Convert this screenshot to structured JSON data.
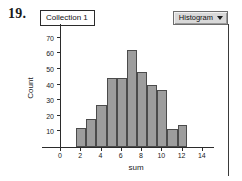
{
  "question_number": "19.",
  "collection": {
    "label": "Collection 1"
  },
  "plot_selector": {
    "label": "Histogram",
    "icon": "chevron-down-icon"
  },
  "chart_data": {
    "type": "bar",
    "title": "",
    "subtitle": "",
    "xlabel": "sum",
    "ylabel": "Count",
    "xlim": [
      0,
      15
    ],
    "ylim": [
      0,
      75
    ],
    "xticks": [
      0,
      2,
      4,
      6,
      8,
      10,
      12,
      14
    ],
    "xtick_labels": [
      "0",
      "2",
      "4",
      "6",
      "8",
      "10",
      "12",
      "14"
    ],
    "yticks": [
      10,
      20,
      30,
      40,
      50,
      60,
      70
    ],
    "ytick_labels": [
      "10",
      "20",
      "30",
      "40",
      "50",
      "60",
      "70"
    ],
    "grid": false,
    "legend": null,
    "bin_width": 1,
    "bin_edges": [
      1.6,
      2.6,
      3.6,
      4.6,
      5.6,
      6.6,
      7.6,
      8.6,
      9.6,
      10.6,
      11.6,
      12.5
    ],
    "categories": [
      "1.6-2.6",
      "2.6-3.6",
      "3.6-4.6",
      "4.6-5.6",
      "5.6-6.6",
      "6.6-7.6",
      "7.6-8.6",
      "8.6-9.6",
      "9.6-10.6",
      "10.6-11.6",
      "11.6-12.5"
    ],
    "values": [
      12,
      18,
      27,
      44,
      44,
      62,
      48,
      39.5,
      36.5,
      11.5,
      14
    ],
    "bar_color": "#9d9d9d",
    "bar_edge_color": "#4b4b4b",
    "axis_color": "#2b2b2b"
  }
}
